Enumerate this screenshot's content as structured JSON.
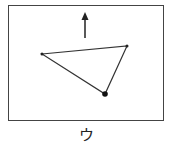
{
  "figure": {
    "label": "ウ",
    "frame": {
      "x": 8,
      "y": 5,
      "width": 155,
      "height": 115
    },
    "arrow": {
      "direction": "up",
      "x": 85,
      "y_tail": 38,
      "y_tip": 12
    },
    "triangle": {
      "vertices": [
        [
          42,
          54
        ],
        [
          127,
          46
        ],
        [
          105,
          94
        ]
      ],
      "large_dot_vertex": 2
    },
    "stroke_color": "#333333"
  }
}
